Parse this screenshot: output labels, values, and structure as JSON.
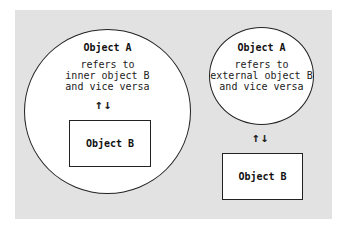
{
  "left": {
    "outer_label": "Object A",
    "description": [
      "refers to",
      "inner object B",
      "and vice versa"
    ],
    "inner_label": "Object B",
    "arrows": "↑↓"
  },
  "right": {
    "outer_label": "Object A",
    "description": [
      "refers to",
      "external object B",
      "and vice versa"
    ],
    "inner_label": "Object B",
    "arrows": "↑↓"
  },
  "colors": {
    "panel": "#e2e2e2",
    "stroke": "#222222",
    "fill": "#ffffff"
  }
}
